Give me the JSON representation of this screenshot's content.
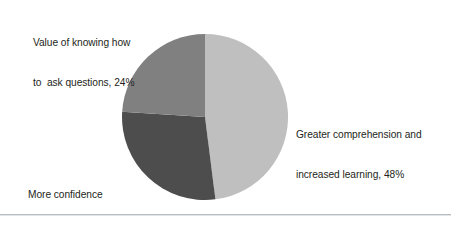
{
  "figure": {
    "background_color": "#ffffff",
    "rule_color": "#b9bdc0"
  },
  "chart_data": {
    "type": "pie",
    "title": "",
    "subtitle": "",
    "xlabel": "",
    "ylabel": "",
    "legend_position": "none",
    "grid": false,
    "start_angle_deg": 0,
    "direction": "clockwise",
    "categories": [
      "Greater comprehension and increased learning",
      "More confidence and independence",
      "Value of knowing how to ask questions"
    ],
    "values": [
      48,
      28,
      24
    ],
    "unit": "%",
    "total": 100,
    "colors": [
      "#bfbfbf",
      "#4d4d4d",
      "#808080"
    ],
    "slices": [
      {
        "name": "Greater comprehension and increased learning",
        "value": 48,
        "value_text": "48%",
        "color": "#bfbfbf",
        "start_angle_deg": 0,
        "end_angle_deg": 172.8,
        "label_lines": [
          "Greater comprehension and",
          "increased learning, 48%"
        ]
      },
      {
        "name": "More confidence and independence",
        "value": 28,
        "value_text": "28%",
        "color": "#4d4d4d",
        "start_angle_deg": 172.8,
        "end_angle_deg": 273.6,
        "label_lines": [
          "More confidence",
          "and independence, 28%"
        ]
      },
      {
        "name": "Value of knowing how to ask questions",
        "value": 24,
        "value_text": "24%",
        "color": "#808080",
        "start_angle_deg": 273.6,
        "end_angle_deg": 360,
        "label_lines": [
          "Value of knowing how",
          "to  ask questions, 24%"
        ]
      }
    ]
  },
  "labels": {
    "knowing": {
      "line1": "Value of knowing how",
      "line2": "to  ask questions, 24%"
    },
    "comprehension": {
      "line1": "Greater comprehension and",
      "line2": "increased learning, 48%"
    },
    "confidence": {
      "line1": "More confidence",
      "line2": "and independence, 28%"
    }
  }
}
